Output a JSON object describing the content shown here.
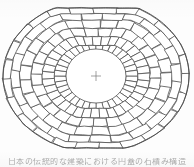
{
  "figure": {
    "name": "dome-radial-masonry-plan",
    "background_color": "#fdfdfd",
    "line_color": "#4a4a4a",
    "fill_color": "#ffffff",
    "center_marker_color": "#7a7a7a",
    "stroke_width": 0.75
  },
  "geometry": {
    "center_x": 96,
    "center_y": 76,
    "radius_x": 93,
    "radius_y": 76,
    "flat_top_y": 8,
    "flat_bottom_y": 148,
    "oculus_radius_x": 30,
    "oculus_radius_y": 27,
    "ring_count": 6,
    "ring_radii_fractions": [
      0.32,
      0.45,
      0.58,
      0.7,
      0.82,
      0.92,
      1.0
    ],
    "sector_count": 36,
    "inner_sector_count": 36,
    "outer_sector_count": 24
  },
  "center_marker": {
    "label": "center-cross",
    "arm_length": 5
  },
  "caption": {
    "text": "日本の伝統的な建築における円蓋の石積み構造",
    "visible_fragment": "日本の伝統的な建築における円蓋の石積み構造",
    "note": "cut-off at bottom edge"
  }
}
